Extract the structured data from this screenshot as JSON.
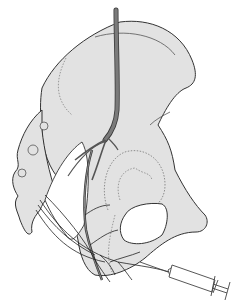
{
  "figure": {
    "description": "Pelvis illustration with nerve (vessel) descending and branching, and a syringe needle inserted near the ischial region",
    "colors": {
      "background": "#ffffff",
      "bone_fill": "#e2e2e2",
      "outline": "#333333",
      "nerve": "#6e6e6e",
      "nerve_outline": "#3a3a3a",
      "dotted": "#777777",
      "syringe": "#444444"
    },
    "labels": []
  }
}
